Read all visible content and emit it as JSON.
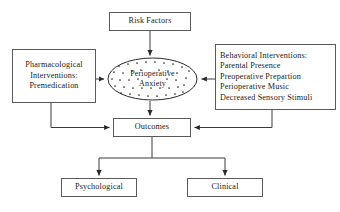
{
  "diagram": {
    "title_text": "Perioperative anxiety conceptual model",
    "nodes": {
      "risk_factors": {
        "label": "Risk Factors",
        "shape": "rectangle"
      },
      "pharmacological": {
        "lines": [
          "Pharmacological",
          "Interventions:",
          "Premedication"
        ],
        "shape": "rectangle"
      },
      "behavioral": {
        "lines": [
          "Behavioral Interventions:",
          "Parental Presence",
          "Preoperative Prepartion",
          "Perioperative Music",
          "Decreased Sensory Stimuli"
        ],
        "shape": "rectangle"
      },
      "anxiety": {
        "lines": [
          "Perioperative",
          "Anxiety"
        ],
        "shape": "ellipse",
        "fill_pattern": "scattered-dots"
      },
      "outcomes": {
        "label": "Outcomes",
        "shape": "rectangle"
      },
      "psychological": {
        "label": "Psychological",
        "shape": "rectangle"
      },
      "clinical": {
        "label": "Clinical",
        "shape": "rectangle"
      }
    },
    "edges": [
      {
        "from": "risk_factors",
        "to": "anxiety",
        "style": "arrow-down"
      },
      {
        "from": "pharmacological",
        "to": "anxiety",
        "style": "arrow-right"
      },
      {
        "from": "behavioral",
        "to": "anxiety",
        "style": "arrow-left"
      },
      {
        "from": "anxiety",
        "to": "outcomes",
        "style": "arrow-down"
      },
      {
        "from": "pharmacological",
        "to": "outcomes",
        "style": "elbow-arrow-right"
      },
      {
        "from": "behavioral",
        "to": "outcomes",
        "style": "elbow-arrow-left"
      },
      {
        "from": "outcomes",
        "to": "psychological",
        "style": "bus-arrow-down"
      },
      {
        "from": "outcomes",
        "to": "clinical",
        "style": "bus-arrow-down"
      }
    ],
    "colors": {
      "background": "#ffffff",
      "box_border": "#5a5a5a",
      "connector": "#3a3a3a",
      "text": "#1a1a1a",
      "dot_fill": "#2a2a2a"
    }
  }
}
